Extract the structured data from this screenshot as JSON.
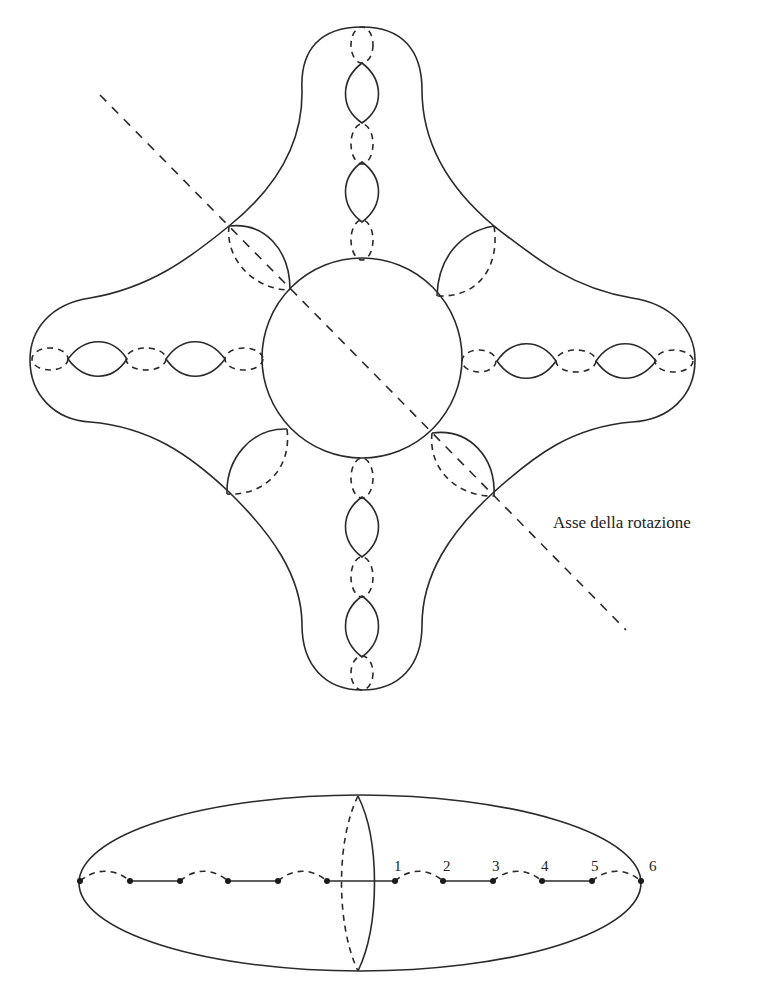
{
  "figure": {
    "top_diagram": {
      "description": "Surface with four symmetric arms and a central sphere, showing handles with dashed/solid circles and a diagonal rotation axis",
      "axis_label": "Asse della rotazione"
    },
    "bottom_diagram": {
      "description": "Ellipse with chain of points on the horizontal axis, connected alternately by solid segments and dashed arcs, bisected by a meridian",
      "point_labels": [
        "1",
        "2",
        "3",
        "4",
        "5",
        "6"
      ]
    }
  },
  "colors": {
    "stroke": "#2a2a2a",
    "background": "#ffffff"
  }
}
